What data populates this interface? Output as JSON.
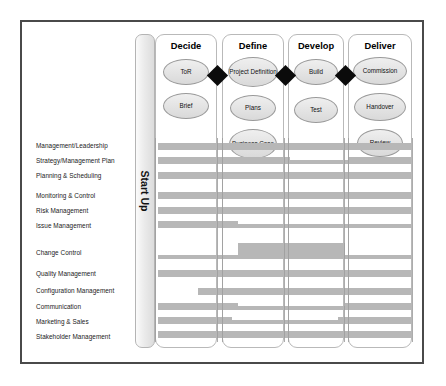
{
  "diagram": {
    "startup": {
      "label": "Start Up"
    },
    "phases": [
      {
        "name": "Decide",
        "deliverables": [
          {
            "label": "ToR"
          },
          {
            "label": "Brief"
          }
        ]
      },
      {
        "name": "Define",
        "deliverables": [
          {
            "label": "Project Definition"
          },
          {
            "label": "Plans"
          },
          {
            "label": "Business Case"
          }
        ]
      },
      {
        "name": "Develop",
        "deliverables": [
          {
            "label": "Build"
          },
          {
            "label": "Test"
          }
        ]
      },
      {
        "name": "Deliver",
        "deliverables": [
          {
            "label": "Commission"
          },
          {
            "label": "Handover"
          },
          {
            "label": "Review"
          }
        ]
      }
    ],
    "gates": [
      {
        "name": "gate-1"
      },
      {
        "name": "gate-2"
      },
      {
        "name": "gate-3"
      }
    ],
    "disciplines": [
      {
        "label": "Management/Leadership"
      },
      {
        "label": "Strategy/Management Plan"
      },
      {
        "label": "Planning & Scheduling"
      },
      {
        "label": "Monitoring & Control"
      },
      {
        "label": "Risk Management"
      },
      {
        "label": "Issue Management"
      },
      {
        "label": "Change Control"
      },
      {
        "label": "Quality Management"
      },
      {
        "label": "Configuration Management"
      },
      {
        "label": "Communication"
      },
      {
        "label": "Marketing & Sales"
      },
      {
        "label": "Stakeholder Management"
      }
    ],
    "colors": {
      "bar": "#b7b7b7",
      "frame_border": "#4a4a4a",
      "phase_border": "#b9b9b9",
      "oval_fill": "#e4e4e4",
      "gate": "#0b0b0b",
      "text": "#1a1a1a"
    }
  },
  "chart_data": {
    "type": "bar",
    "xlabel": "",
    "ylabel": "",
    "categories": [
      "Management/Leadership",
      "Strategy/Management Plan",
      "Planning & Scheduling",
      "Monitoring & Control",
      "Risk Management",
      "Issue Management",
      "Change Control",
      "Quality Management",
      "Configuration Management",
      "Communication",
      "Marketing & Sales",
      "Stakeholder Management"
    ],
    "phase_axis": [
      "Decide",
      "Define",
      "Develop",
      "Deliver"
    ],
    "segments": [
      {
        "row": 0,
        "label": "Management/Leadership",
        "start_px": 158,
        "end_px": 412,
        "y_px": 143,
        "h_px": 7,
        "thickness": "full"
      },
      {
        "row": 1,
        "label": "Strategy/Management Plan",
        "start_px": 158,
        "end_px": 290,
        "y_px": 157,
        "h_px": 7,
        "thickness": "full"
      },
      {
        "row": 1,
        "label": "Strategy/Management Plan",
        "start_px": 290,
        "end_px": 348,
        "y_px": 160,
        "h_px": 4,
        "thickness": "thin"
      },
      {
        "row": 1,
        "label": "Strategy/Management Plan",
        "start_px": 348,
        "end_px": 412,
        "y_px": 157,
        "h_px": 7,
        "thickness": "full"
      },
      {
        "row": 2,
        "label": "Planning & Scheduling",
        "start_px": 158,
        "end_px": 412,
        "y_px": 172,
        "h_px": 7,
        "thickness": "full"
      },
      {
        "row": 3,
        "label": "Monitoring & Control",
        "start_px": 158,
        "end_px": 412,
        "y_px": 192,
        "h_px": 7,
        "thickness": "full"
      },
      {
        "row": 4,
        "label": "Risk Management",
        "start_px": 158,
        "end_px": 412,
        "y_px": 207,
        "h_px": 7,
        "thickness": "full"
      },
      {
        "row": 5,
        "label": "Issue Management",
        "start_px": 158,
        "end_px": 238,
        "y_px": 221,
        "h_px": 7,
        "thickness": "full"
      },
      {
        "row": 5,
        "label": "Issue Management",
        "start_px": 238,
        "end_px": 412,
        "y_px": 224,
        "h_px": 4,
        "thickness": "thin"
      },
      {
        "row": 6,
        "label": "Change Control",
        "start_px": 158,
        "end_px": 238,
        "y_px": 255,
        "h_px": 4,
        "thickness": "thin"
      },
      {
        "row": 6,
        "label": "Change Control",
        "start_px": 238,
        "end_px": 345,
        "y_px": 243,
        "h_px": 16,
        "thickness": "tall"
      },
      {
        "row": 6,
        "label": "Change Control",
        "start_px": 345,
        "end_px": 412,
        "y_px": 255,
        "h_px": 4,
        "thickness": "thin"
      },
      {
        "row": 7,
        "label": "Quality Management",
        "start_px": 158,
        "end_px": 412,
        "y_px": 270,
        "h_px": 7,
        "thickness": "full"
      },
      {
        "row": 8,
        "label": "Configuration Management",
        "start_px": 198,
        "end_px": 412,
        "y_px": 288,
        "h_px": 7,
        "thickness": "full"
      },
      {
        "row": 9,
        "label": "Communication",
        "start_px": 158,
        "end_px": 238,
        "y_px": 303,
        "h_px": 7,
        "thickness": "full"
      },
      {
        "row": 9,
        "label": "Communication",
        "start_px": 238,
        "end_px": 345,
        "y_px": 306,
        "h_px": 4,
        "thickness": "thin"
      },
      {
        "row": 9,
        "label": "Communication",
        "start_px": 345,
        "end_px": 412,
        "y_px": 303,
        "h_px": 7,
        "thickness": "full"
      },
      {
        "row": 10,
        "label": "Marketing & Sales",
        "start_px": 158,
        "end_px": 232,
        "y_px": 317,
        "h_px": 7,
        "thickness": "full"
      },
      {
        "row": 10,
        "label": "Marketing & Sales",
        "start_px": 232,
        "end_px": 338,
        "y_px": 320,
        "h_px": 4,
        "thickness": "thin"
      },
      {
        "row": 10,
        "label": "Marketing & Sales",
        "start_px": 338,
        "end_px": 412,
        "y_px": 317,
        "h_px": 7,
        "thickness": "full"
      },
      {
        "row": 11,
        "label": "Stakeholder Management",
        "start_px": 158,
        "end_px": 412,
        "y_px": 331,
        "h_px": 7,
        "thickness": "full"
      }
    ],
    "label_y_px": [
      146,
      161,
      176,
      196,
      211,
      226,
      253,
      274,
      291,
      307,
      322,
      337
    ],
    "legend": [],
    "grid": false
  },
  "layout": {
    "phase_x_px": [
      155,
      222,
      288,
      348
    ],
    "phase_w_px": [
      62,
      62,
      56,
      64
    ],
    "gate_x_px": [
      210,
      278,
      338
    ],
    "gate_y_px": 68
  }
}
